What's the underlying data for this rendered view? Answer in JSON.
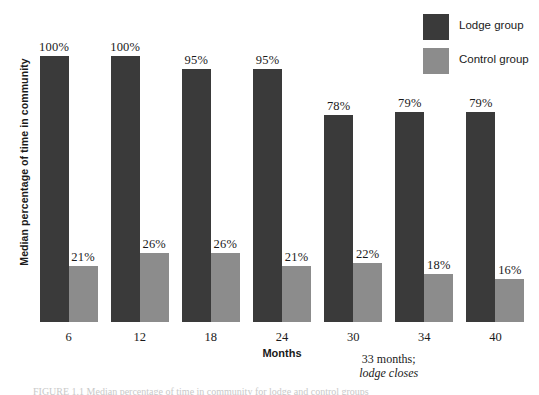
{
  "chart_data": {
    "type": "bar",
    "title": "",
    "xlabel": "Months",
    "ylabel": "Median percentage of time in community",
    "ylim": [
      0,
      100
    ],
    "grid": false,
    "legend_position": "top-right",
    "categories": [
      "6",
      "12",
      "18",
      "24",
      "30",
      "34",
      "40"
    ],
    "series": [
      {
        "name": "Lodge group",
        "color": "#3a3a3a",
        "values": [
          100,
          100,
          95,
          95,
          78,
          79,
          79
        ],
        "labels": [
          "100%",
          "100%",
          "95%",
          "95%",
          "78%",
          "79%",
          "79%"
        ]
      },
      {
        "name": "Control group",
        "color": "#8c8c8c",
        "values": [
          21,
          26,
          26,
          21,
          22,
          18,
          16
        ],
        "labels": [
          "21%",
          "26%",
          "26%",
          "21%",
          "22%",
          "18%",
          "16%"
        ]
      }
    ],
    "annotations": [
      {
        "line1": "33 months;",
        "line2": "lodge closes",
        "between_categories": [
          "30",
          "34"
        ]
      }
    ]
  },
  "legend": {
    "items": [
      {
        "label": "Lodge group",
        "color": "#3a3a3a"
      },
      {
        "label": "Control group",
        "color": "#8c8c8c"
      }
    ]
  },
  "caption": {
    "text": "FIGURE 1.1 Median percentage of time in community for lodge and control groups"
  }
}
